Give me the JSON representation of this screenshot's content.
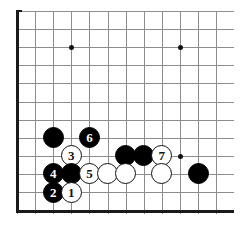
{
  "figure": {
    "kind": "go-board-diagram",
    "width": 249,
    "height": 230
  },
  "board": {
    "grid": {
      "origin_x": 17,
      "origin_y": 11,
      "spacing": 18.1,
      "cols": 12,
      "rows": 12,
      "grid_color": "#8d8d8d",
      "edge_color": "#1a1a1a",
      "background": "#ffffff",
      "show_left_edge": true,
      "show_top_edge": true,
      "show_bottom_edge": true,
      "show_right_edge": false
    },
    "star_points": [
      {
        "col": 3,
        "row": 2
      },
      {
        "col": 9,
        "row": 2
      },
      {
        "col": 9,
        "row": 8
      }
    ]
  },
  "stones": [
    {
      "id": "b-a",
      "color": "black",
      "col": 2,
      "row": 7,
      "label": ""
    },
    {
      "id": "m6",
      "color": "black",
      "col": 4,
      "row": 7,
      "label": "6"
    },
    {
      "id": "m3",
      "color": "white",
      "col": 3,
      "row": 8,
      "label": "3"
    },
    {
      "id": "b-b",
      "color": "black",
      "col": 6,
      "row": 8,
      "label": ""
    },
    {
      "id": "b-c",
      "color": "black",
      "col": 7,
      "row": 8,
      "label": ""
    },
    {
      "id": "m7",
      "color": "white",
      "col": 8,
      "row": 8,
      "label": "7"
    },
    {
      "id": "m4",
      "color": "black",
      "col": 2,
      "row": 9,
      "label": "4"
    },
    {
      "id": "b-d",
      "color": "black",
      "col": 3,
      "row": 9,
      "label": ""
    },
    {
      "id": "m5",
      "color": "white",
      "col": 4,
      "row": 9,
      "label": "5"
    },
    {
      "id": "w-a",
      "color": "white",
      "col": 5,
      "row": 9,
      "label": ""
    },
    {
      "id": "w-b",
      "color": "white",
      "col": 6,
      "row": 9,
      "label": ""
    },
    {
      "id": "w-c",
      "color": "white",
      "col": 8,
      "row": 9,
      "label": ""
    },
    {
      "id": "b-e",
      "color": "black",
      "col": 10,
      "row": 9,
      "label": ""
    },
    {
      "id": "m2",
      "color": "black",
      "col": 2,
      "row": 10,
      "label": "2"
    },
    {
      "id": "m1",
      "color": "white",
      "col": 3,
      "row": 10,
      "label": "1"
    }
  ],
  "colors": {
    "black_stone": "#000000",
    "white_stone": "#ffffff",
    "stone_outline": "#111111",
    "black_label": "#ffffff",
    "white_label": "#111111"
  }
}
